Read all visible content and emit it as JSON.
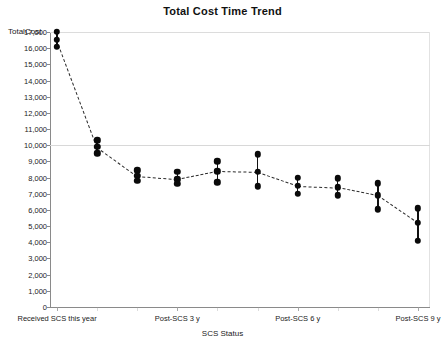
{
  "chart_data": {
    "type": "line",
    "title": "Total Cost Time Trend",
    "xlabel": "SCS Status",
    "ylabel": "TotalCost",
    "ylim": [
      0,
      17000
    ],
    "ytick_labels": [
      "17,000",
      "16,000",
      "15,000",
      "14,000",
      "13,000",
      "12,000",
      "11,000",
      "10,000",
      "9,000",
      "8,000",
      "7,000",
      "6,000",
      "5,000",
      "4,000",
      "3,000",
      "2,000",
      "1,000",
      "0"
    ],
    "ytick_values": [
      17000,
      16000,
      15000,
      14000,
      13000,
      12000,
      11000,
      10000,
      9000,
      8000,
      7000,
      6000,
      5000,
      4000,
      3000,
      2000,
      1000,
      0
    ],
    "grid": true,
    "gridline_values": [
      10000
    ],
    "legend": "none",
    "xtick_labels": [
      "Received SCS this year",
      "Post-SCS 3 y",
      "Post-SCS 6 y",
      "Post-SCS 9 y"
    ],
    "xtick_positions": [
      0,
      3,
      6,
      9
    ],
    "marker": "filled-circle-with-error-bars",
    "line_style": "dashed",
    "x": [
      0,
      1,
      2,
      3,
      4,
      5,
      6,
      7,
      8,
      9
    ],
    "values": [
      16500,
      9900,
      8100,
      7900,
      8400,
      8350,
      7500,
      7400,
      6900,
      5200
    ],
    "error_low": [
      16100,
      9500,
      7800,
      7600,
      7700,
      7450,
      7000,
      6900,
      6050,
      4100
    ],
    "error_high": [
      17000,
      10300,
      8450,
      8350,
      9000,
      9450,
      8000,
      7950,
      7650,
      6100
    ],
    "series": [
      {
        "name": "TotalCost",
        "points": [
          {
            "x": 0,
            "y": 16500,
            "low": 16100,
            "high": 17000
          },
          {
            "x": 1,
            "y": 9900,
            "low": 9500,
            "high": 10300
          },
          {
            "x": 2,
            "y": 8100,
            "low": 7800,
            "high": 8450
          },
          {
            "x": 3,
            "y": 7900,
            "low": 7600,
            "high": 8350
          },
          {
            "x": 4,
            "y": 8400,
            "low": 7700,
            "high": 9000
          },
          {
            "x": 5,
            "y": 8350,
            "low": 7450,
            "high": 9450
          },
          {
            "x": 6,
            "y": 7500,
            "low": 7000,
            "high": 8000
          },
          {
            "x": 7,
            "y": 7400,
            "low": 6900,
            "high": 7950
          },
          {
            "x": 8,
            "y": 6900,
            "low": 6050,
            "high": 7650
          },
          {
            "x": 9,
            "y": 5200,
            "low": 4100,
            "high": 6100
          }
        ]
      }
    ]
  }
}
